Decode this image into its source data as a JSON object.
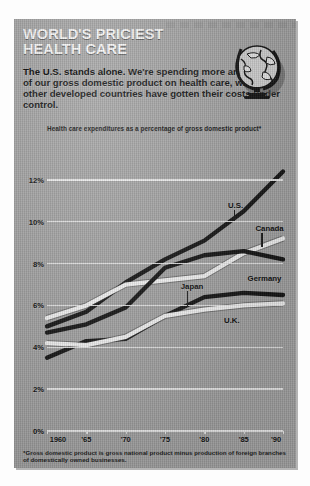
{
  "header": {
    "title_line1": "WORLD'S PRICIEST",
    "title_line2": "HEALTH CARE",
    "deck_lead": "The U.S. stands alone.",
    "deck_body": " We're spending more and more of our gross domestic product on health care, while other developed countries have gotten their costs under control.",
    "globe_icon": "globe-icon"
  },
  "notes": {
    "footnote": "*Gross domestic product is gross national product minus production of foreign branches of domestically owned businesses.",
    "source": "Source: Organization for Economic Cooperation and Development."
  },
  "colors": {
    "panel_bg": "#a9a9a9",
    "gridline": "#f4f4f4",
    "dark_series": "#141414",
    "light_series": "#fbfbfb",
    "title_text": "#fbfbfb",
    "body_text": "#131313"
  },
  "chart_data": {
    "type": "line",
    "title": "Health care expenditures as a percentage of gross domestic product*",
    "xlabel": "",
    "ylabel": "",
    "xlim": [
      1960,
      1990
    ],
    "ylim": [
      0,
      13
    ],
    "grid": true,
    "legend": "inline-labels",
    "ytick_labels": [
      "0%",
      "2%",
      "4%",
      "6%",
      "8%",
      "10%",
      "12%"
    ],
    "ytick_values": [
      0,
      2,
      4,
      6,
      8,
      10,
      12
    ],
    "xtick_labels": [
      "1960",
      "'65",
      "'70",
      "'75",
      "'80",
      "'85",
      "'90"
    ],
    "xtick_values": [
      1960,
      1965,
      1970,
      1975,
      1980,
      1985,
      1990
    ],
    "x": [
      1960,
      1965,
      1970,
      1975,
      1980,
      1985,
      1990
    ],
    "series": [
      {
        "name": "U.S.",
        "style": "dark",
        "label_x": 1983.0,
        "label_y": 11.0,
        "values": [
          5.0,
          5.7,
          7.1,
          8.2,
          9.1,
          10.5,
          12.4
        ]
      },
      {
        "name": "Canada",
        "style": "light",
        "label_x": 1986.5,
        "label_y": 9.9,
        "values": [
          5.4,
          6.0,
          7.0,
          7.2,
          7.4,
          8.5,
          9.2
        ]
      },
      {
        "name": "Germany",
        "style": "dark",
        "label_x": 1985.5,
        "label_y": 7.5,
        "values": [
          4.7,
          5.1,
          5.9,
          7.8,
          8.4,
          8.6,
          8.2
        ]
      },
      {
        "name": "Japan",
        "style": "dark",
        "label_x": 1977.0,
        "label_y": 7.1,
        "values": [
          3.5,
          4.3,
          4.4,
          5.5,
          6.4,
          6.6,
          6.5
        ]
      },
      {
        "name": "U.K.",
        "style": "light",
        "label_x": 1982.5,
        "label_y": 5.5,
        "values": [
          4.2,
          4.1,
          4.5,
          5.5,
          5.8,
          6.0,
          6.1
        ]
      }
    ]
  }
}
